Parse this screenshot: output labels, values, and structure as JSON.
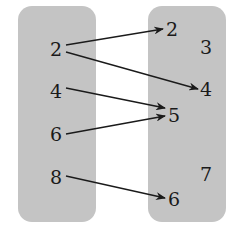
{
  "diagram": {
    "type": "mapping",
    "domain": {
      "elements": [
        {
          "label": "2",
          "x": 50,
          "y": 40
        },
        {
          "label": "4",
          "x": 50,
          "y": 82
        },
        {
          "label": "6",
          "x": 50,
          "y": 125
        },
        {
          "label": "8",
          "x": 50,
          "y": 168
        }
      ]
    },
    "range": {
      "elements": [
        {
          "label": "2",
          "x": 166,
          "y": 20
        },
        {
          "label": "3",
          "x": 200,
          "y": 38
        },
        {
          "label": "4",
          "x": 200,
          "y": 80
        },
        {
          "label": "5",
          "x": 168,
          "y": 106
        },
        {
          "label": "7",
          "x": 200,
          "y": 165
        },
        {
          "label": "6",
          "x": 168,
          "y": 190
        }
      ]
    },
    "arrows": [
      {
        "from": "2",
        "to": "2",
        "x1": 66,
        "y1": 45,
        "x2": 163,
        "y2": 29
      },
      {
        "from": "2",
        "to": "4",
        "x1": 66,
        "y1": 52,
        "x2": 198,
        "y2": 89
      },
      {
        "from": "4",
        "to": "5",
        "x1": 66,
        "y1": 88,
        "x2": 165,
        "y2": 108
      },
      {
        "from": "6",
        "to": "5",
        "x1": 66,
        "y1": 134,
        "x2": 165,
        "y2": 116
      },
      {
        "from": "8",
        "to": "6",
        "x1": 66,
        "y1": 176,
        "x2": 165,
        "y2": 198
      }
    ],
    "colors": {
      "set_fill": "#c4c4c4",
      "ink": "#1a1a1a"
    }
  }
}
